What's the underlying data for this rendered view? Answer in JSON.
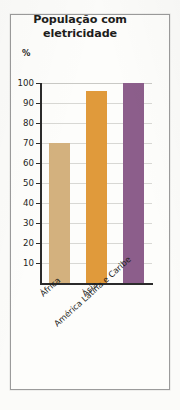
{
  "chart_data": {
    "type": "bar",
    "title": "População com eletricidade",
    "title_lines": [
      "População com",
      "eletricidade"
    ],
    "categories": [
      "África",
      "Ásia",
      "América Latina e Caribe"
    ],
    "values": [
      70,
      96,
      100
    ],
    "xlabel": "",
    "ylabel": "%",
    "ylim": [
      0,
      100
    ],
    "ytick_labels": [
      "100",
      "90",
      "80",
      "70",
      "60",
      "50",
      "40",
      "30",
      "20",
      "10"
    ],
    "ytick_values": [
      100,
      90,
      80,
      70,
      60,
      50,
      40,
      30,
      20,
      10
    ],
    "grid": true,
    "legend": "none",
    "colors": [
      "#d3b17e",
      "#e09a3b",
      "#8c5e8b"
    ]
  },
  "figure": {
    "unit_label": "%"
  }
}
